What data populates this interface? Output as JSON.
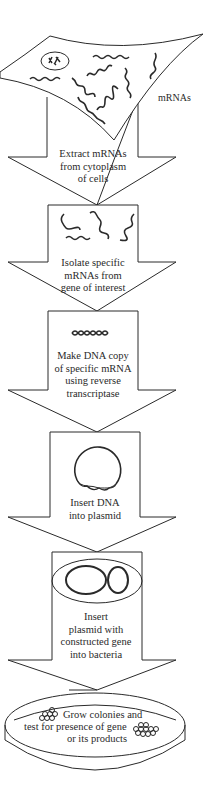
{
  "diagram": {
    "cell_label": "mRNAs",
    "steps": [
      {
        "lines": [
          "Extract mRNAs",
          "from cytoplasm",
          "of cells"
        ]
      },
      {
        "lines": [
          "Isolate specific",
          "mRNAs from",
          "gene of interest"
        ]
      },
      {
        "lines": [
          "Make DNA copy",
          "of specific mRNA",
          "using reverse",
          "transcriptase"
        ]
      },
      {
        "lines": [
          "Insert DNA",
          "into plasmid"
        ]
      },
      {
        "lines": [
          "Insert",
          "plasmid with",
          "constructed gene",
          "into bacteria"
        ]
      }
    ],
    "final_step": {
      "lines": [
        "Grow colonies and",
        "test for presence of gene",
        "or its products"
      ]
    },
    "colors": {
      "stroke": "#2a2a2a",
      "background": "#ffffff"
    }
  }
}
